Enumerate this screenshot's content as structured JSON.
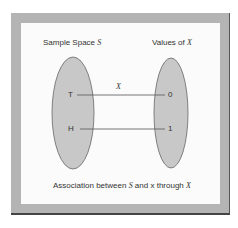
{
  "diagram": {
    "left_title": "Sample Space",
    "left_symbol": "S",
    "right_title": "Values of",
    "right_symbol": "X",
    "mapping_label": "X",
    "left_elements": [
      "T",
      "H"
    ],
    "right_elements": [
      "0",
      "1"
    ],
    "caption_parts": {
      "a": "Association between",
      "s": "S",
      "b": "and x through",
      "x": "X"
    },
    "colors": {
      "frame": "#b4b4b4",
      "panel": "#fbfbfb",
      "ellipse_fill": "#c8c8c8",
      "ellipse_stroke": "#666666",
      "line": "#555555"
    }
  }
}
